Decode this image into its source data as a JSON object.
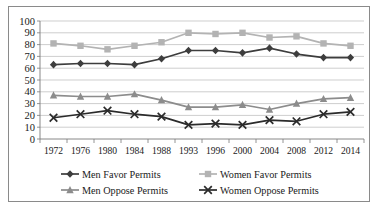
{
  "chart_data": {
    "type": "line",
    "title": "",
    "subtitle": "",
    "xlabel": "",
    "ylabel": "",
    "categories": [
      "1972",
      "1976",
      "1980",
      "1984",
      "1988",
      "1993",
      "1996",
      "2000",
      "2004",
      "2008",
      "2012",
      "2014"
    ],
    "x": [
      1972,
      1976,
      1980,
      1984,
      1988,
      1993,
      1996,
      2000,
      2004,
      2008,
      2012,
      2014
    ],
    "ylim": [
      0,
      100
    ],
    "ytick_labels": [
      "0",
      "10",
      "20",
      "30",
      "40",
      "50",
      "60",
      "70",
      "80",
      "90",
      "100"
    ],
    "ytick_values": [
      0,
      10,
      20,
      30,
      40,
      50,
      60,
      70,
      80,
      90,
      100
    ],
    "grid": "horizontal",
    "legend_position": "bottom",
    "series": [
      {
        "name": "Men Favor Permits",
        "marker": "diamond",
        "color": "#3d3d3d",
        "values": [
          63,
          64,
          64,
          63,
          68,
          75,
          75,
          73,
          77,
          72,
          69,
          69
        ]
      },
      {
        "name": "Women Favor Permits",
        "marker": "square",
        "color": "#b3b3b3",
        "values": [
          81,
          79,
          76,
          79,
          82,
          90,
          89,
          90,
          86,
          87,
          81,
          79
        ]
      },
      {
        "name": "Men Oppose Permits",
        "marker": "triangle",
        "color": "#8c8c8c",
        "values": [
          37,
          36,
          36,
          38,
          33,
          27,
          27,
          29,
          25,
          30,
          34,
          35
        ]
      },
      {
        "name": "Women Oppose Permits",
        "marker": "cross",
        "color": "#2b2b2b",
        "values": [
          18,
          21,
          24,
          21,
          19,
          12,
          13,
          12,
          16,
          15,
          21,
          23
        ]
      }
    ]
  },
  "legend": {
    "entries": [
      {
        "label": "Men Favor Permits"
      },
      {
        "label": "Women Favor Permits"
      },
      {
        "label": "Men Oppose Permits"
      },
      {
        "label": "Women Oppose Permits"
      }
    ]
  }
}
